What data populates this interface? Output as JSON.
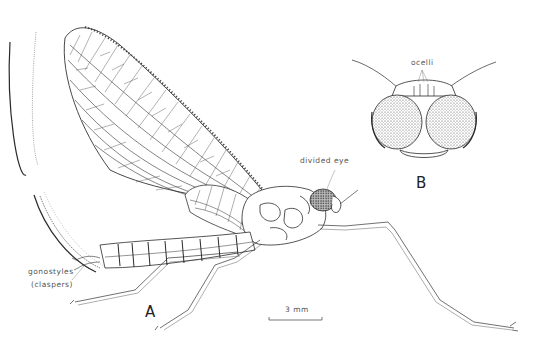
{
  "figure": {
    "panels": [
      {
        "id": "A",
        "label": "A",
        "description": "Lateral view of adult mayfly with wings, legs, abdomen and caudal filaments"
      },
      {
        "id": "B",
        "label": "B",
        "description": "Frontal view of head showing divided compound eyes"
      }
    ],
    "annotations": [
      {
        "id": "ocelli",
        "text": "ocelli"
      },
      {
        "id": "divided-eye",
        "text": "divided  eye"
      },
      {
        "id": "gonostyles",
        "text": "gonostyles"
      },
      {
        "id": "claspers",
        "text": "(claspers)"
      }
    ],
    "scale_bar": {
      "label": "3 mm"
    }
  },
  "colors": {
    "ink": "#2a2a2a",
    "light_ink": "#777777",
    "background": "#ffffff"
  }
}
